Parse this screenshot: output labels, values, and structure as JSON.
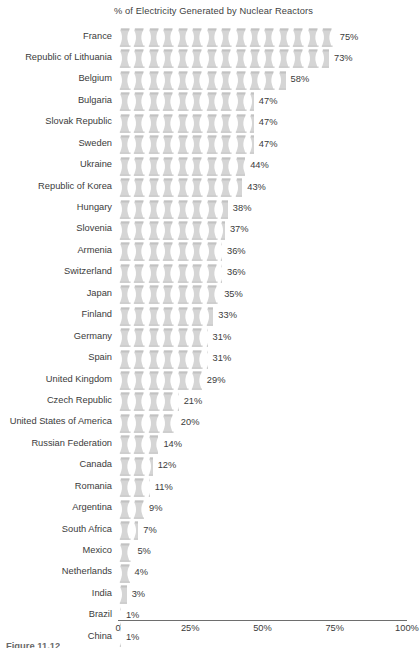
{
  "chart_data": {
    "type": "bar",
    "title": "% of Electricity Generated by Nuclear Reactors",
    "xlabel": "",
    "ylabel": "",
    "xlim": [
      0,
      100
    ],
    "grid": false,
    "legend": null,
    "icon_unit_percent": 5,
    "icon": "cooling-tower-icon",
    "categories": [
      "France",
      "Republic of Lithuania",
      "Belgium",
      "Bulgaria",
      "Slovak Republic",
      "Sweden",
      "Ukraine",
      "Republic of Korea",
      "Hungary",
      "Slovenia",
      "Armenia",
      "Switzerland",
      "Japan",
      "Finland",
      "Germany",
      "Spain",
      "United Kingdom",
      "Czech Republic",
      "United States of America",
      "Russian Federation",
      "Canada",
      "Romania",
      "Argentina",
      "South Africa",
      "Mexico",
      "Netherlands",
      "India",
      "Brazil",
      "China"
    ],
    "values": [
      75,
      73,
      58,
      47,
      47,
      47,
      44,
      43,
      38,
      37,
      36,
      36,
      35,
      33,
      31,
      31,
      29,
      21,
      20,
      14,
      12,
      11,
      9,
      7,
      5,
      4,
      3,
      1,
      1
    ],
    "value_labels": [
      "75%",
      "73%",
      "58%",
      "47%",
      "47%",
      "47%",
      "44%",
      "43%",
      "38%",
      "37%",
      "36%",
      "36%",
      "35%",
      "33%",
      "31%",
      "31%",
      "29%",
      "21%",
      "20%",
      "14%",
      "12%",
      "11%",
      "9%",
      "7%",
      "5%",
      "4%",
      "3%",
      "1%",
      "1%"
    ],
    "xticks": [
      0,
      25,
      50,
      75,
      100
    ],
    "xtick_labels": [
      "0",
      "25%",
      "50%",
      "75%",
      "100%"
    ]
  },
  "colors": {
    "icon_fill": "#d5d5d5",
    "icon_shade": "#c2c2c2",
    "text": "#3b3b3b",
    "axis": "#6e6e6e",
    "background": "#ffffff",
    "caption": "#6a6a6a"
  },
  "caption": {
    "text": "Figure 11.12"
  }
}
